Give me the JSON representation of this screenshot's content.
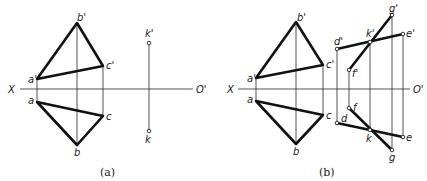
{
  "figure": {
    "axis_labels": {
      "left": "X",
      "right": "O'"
    },
    "panels": [
      {
        "id": "a",
        "caption": "(a)",
        "points": {
          "a1": "a'",
          "b1": "b'",
          "c1": "c'",
          "a": "a",
          "b": "b",
          "c": "c",
          "k1": "k'",
          "k": "k"
        }
      },
      {
        "id": "b",
        "caption": "(b)",
        "points": {
          "a1": "a'",
          "b1": "b'",
          "c1": "c'",
          "a": "a",
          "b": "b",
          "c": "c",
          "d1": "d'",
          "e1": "e'",
          "f1": "f'",
          "g1": "g'",
          "k1": "k'",
          "d": "d",
          "e": "e",
          "f": "f",
          "g": "g",
          "k": "k"
        }
      }
    ],
    "colors": {
      "line": "#111111",
      "background": "#ffffff"
    }
  }
}
